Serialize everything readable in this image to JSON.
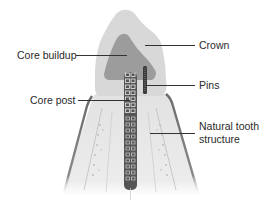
{
  "diagram": {
    "labels": {
      "crown": "Crown",
      "core_buildup": "Core buildup",
      "pins": "Pins",
      "core_post": "Core post",
      "natural_tooth_line1": "Natural tooth",
      "natural_tooth_line2": "structure"
    },
    "colors": {
      "background": "#ffffff",
      "crown": "#d6d6d6",
      "core_buildup": "#9a9a9a",
      "root": "#e6e6e6",
      "root_outline": "#6e6e6e",
      "post": "#4a4a4a",
      "text": "#2a2a2a"
    }
  }
}
